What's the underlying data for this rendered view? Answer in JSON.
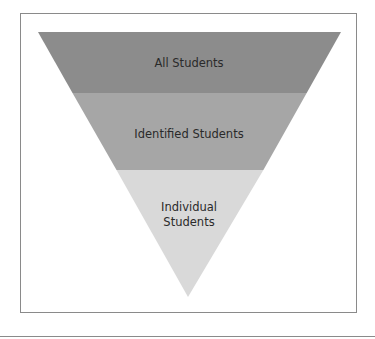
{
  "diagram": {
    "type": "inverted-pyramid",
    "levels": [
      {
        "label": "All Students",
        "color": "#8c8c8c"
      },
      {
        "label": "Identified Students",
        "color": "#a6a6a6"
      },
      {
        "label_line1": "Individual",
        "label_line2": "Students",
        "color": "#d9d9d9"
      }
    ]
  }
}
